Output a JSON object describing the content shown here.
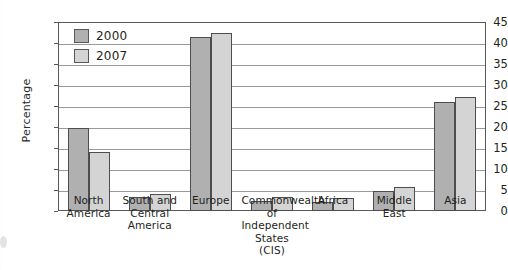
{
  "chart_data": {
    "type": "bar",
    "title": "",
    "xlabel": "",
    "ylabel": "Percentage",
    "ylim": [
      0,
      45
    ],
    "ytick_step": 5,
    "yticks": [
      0,
      5,
      10,
      15,
      20,
      25,
      30,
      35,
      40,
      45
    ],
    "grid": true,
    "legend_position": "top-left",
    "categories": [
      "North America",
      "South and Central America",
      "Europe",
      "Commonwealth of Independent States (CIS)",
      "Africa",
      "Middle East",
      "Asia"
    ],
    "category_lines": [
      [
        "North",
        "America"
      ],
      [
        "South and",
        "Central",
        "America"
      ],
      [
        "Europe"
      ],
      [
        "Commonwealth",
        "of Independent",
        "States (CIS)"
      ],
      [
        "Africa"
      ],
      [
        "Middle",
        "East"
      ],
      [
        "Asia"
      ]
    ],
    "series": [
      {
        "name": "2000",
        "color": "#b0b0b0",
        "values": [
          19.8,
          3.3,
          41.5,
          2.5,
          2.2,
          4.8,
          26.0
        ]
      },
      {
        "name": "2007",
        "color": "#d4d4d4",
        "values": [
          14.0,
          4.0,
          42.3,
          3.3,
          3.0,
          5.8,
          27.2
        ]
      }
    ]
  },
  "legend": {
    "items": [
      {
        "label": "2000",
        "swatch": "dark-gray"
      },
      {
        "label": "2007",
        "swatch": "light-gray"
      }
    ]
  },
  "axes": {
    "y_title": "Percentage"
  }
}
